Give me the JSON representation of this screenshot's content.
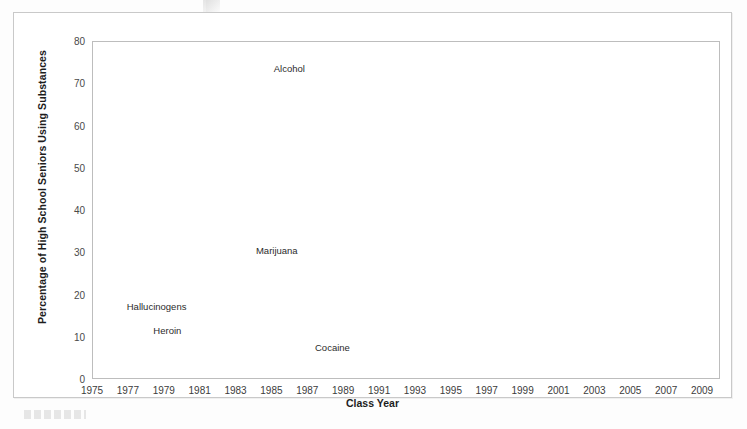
{
  "figure": {
    "x_axis_title": "Class Year",
    "y_axis_title": "Percentage of High School Seniors Using Substances"
  },
  "chart_data": {
    "type": "line",
    "title": "",
    "xlabel": "Class Year",
    "ylabel": "Percentage of High School Seniors Using Substances",
    "xlim": [
      1975,
      2010
    ],
    "ylim": [
      0,
      80
    ],
    "grid": true,
    "legend_position": "inline-labels",
    "x": [
      1975,
      1976,
      1977,
      1978,
      1979,
      1980,
      1981,
      1982,
      1983,
      1984,
      1985,
      1986,
      1987,
      1988,
      1989,
      1990,
      1991,
      1992,
      1993,
      1994,
      1995,
      1996,
      1997,
      1998,
      1999,
      2000,
      2001,
      2002,
      2003,
      2004,
      2005,
      2006,
      2007,
      2008,
      2009
    ],
    "x_tick_labels": [
      "1975",
      "1977",
      "1979",
      "1981",
      "1983",
      "1985",
      "1987",
      "1989",
      "1991",
      "1993",
      "1995",
      "1997",
      "1999",
      "2001",
      "2003",
      "2005",
      "2007",
      "2009"
    ],
    "y_tick_labels": [
      "0",
      "10",
      "20",
      "30",
      "40",
      "50",
      "60",
      "70",
      "80"
    ],
    "series": [
      {
        "name": "Alcohol",
        "color": "#8a8a8a",
        "style": "solid",
        "width": 3.6,
        "label_x": 1986,
        "label_y": 73.5,
        "values": [
          68.2,
          68.3,
          70.0,
          72.3,
          71.9,
          72.0,
          72.1,
          70.8,
          69.5,
          67.3,
          65.9,
          65.3,
          66.4,
          63.9,
          60.0,
          57.1,
          54.0,
          51.3,
          48.6,
          50.1,
          51.3,
          50.8,
          52.7,
          52.0,
          51.0,
          50.0,
          49.8,
          48.6,
          47.5,
          48.0,
          47.0,
          45.3,
          44.4,
          43.1,
          43.5
        ]
      },
      {
        "name": "Marijuana",
        "color": "#6f6f6f",
        "style": "solid",
        "width": 3.6,
        "label_x": 1985.3,
        "label_y": 30.6,
        "values": [
          27.1,
          32.2,
          35.4,
          37.1,
          36.5,
          33.7,
          31.6,
          28.5,
          27.0,
          25.2,
          25.7,
          23.4,
          21.0,
          18.0,
          16.7,
          14.0,
          13.8,
          11.9,
          15.5,
          19.0,
          21.2,
          21.9,
          23.7,
          22.8,
          23.1,
          21.6,
          22.4,
          21.5,
          21.2,
          19.9,
          19.8,
          19.8,
          20.0,
          20.6,
          21.4
        ]
      },
      {
        "name": "Cocaine",
        "color": "#2b2b2b",
        "style": "solid",
        "width": 2.6,
        "label_x": 1988.4,
        "label_y": 7.6,
        "values": [
          1.9,
          2.0,
          2.9,
          3.9,
          5.7,
          5.2,
          5.8,
          5.0,
          4.9,
          5.8,
          6.7,
          6.2,
          4.3,
          3.4,
          2.8,
          1.9,
          1.4,
          1.3,
          1.3,
          2.0,
          2.6,
          2.0,
          2.3,
          2.4,
          2.6,
          2.1,
          2.1,
          2.3,
          2.2,
          2.3,
          2.3,
          2.5,
          2.0,
          1.9,
          1.9
        ]
      },
      {
        "name": "Hallucinogens",
        "color": "#1a1a1a",
        "style": "dotted",
        "width": 3.0,
        "label_x": 1978.6,
        "label_y": 17.2,
        "leader_to_x": 1981.5,
        "leader_to_y": 2.3,
        "values": [
          1.8,
          1.8,
          1.6,
          1.9,
          1.8,
          1.9,
          1.9,
          2.0,
          1.9,
          1.8,
          1.8,
          1.8,
          1.7,
          1.6,
          1.6,
          1.6,
          1.6,
          1.5,
          1.9,
          2.1,
          2.5,
          2.8,
          2.8,
          3.0,
          3.5,
          5.8,
          5.9,
          5.3,
          4.5,
          2.3,
          1.9,
          1.6,
          1.7,
          1.7,
          1.8
        ]
      },
      {
        "name": "Heroin",
        "color": "#b5b5b5",
        "style": "solid",
        "width": 3.0,
        "label_x": 1979.2,
        "label_y": 11.6,
        "leader_to_x": 1981.9,
        "leader_to_y": 0.6,
        "values": [
          0.6,
          0.6,
          0.5,
          0.5,
          0.5,
          0.5,
          0.5,
          0.6,
          0.6,
          0.5,
          0.6,
          0.5,
          0.5,
          0.5,
          0.6,
          0.5,
          0.4,
          0.6,
          0.5,
          0.6,
          0.6,
          0.5,
          0.5,
          0.5,
          0.5,
          0.7,
          0.9,
          0.9,
          0.8,
          0.9,
          0.5,
          0.8,
          0.9,
          0.7,
          0.7
        ]
      }
    ]
  }
}
